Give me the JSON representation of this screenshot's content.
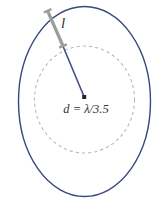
{
  "figure": {
    "labels": {
      "element_length": "l",
      "diameter": "d = λ/3.5"
    },
    "colors": {
      "background": "#ffffff",
      "boundary": "#39497b",
      "feed_line": "#41507f",
      "element_bar": "#9c9c9c",
      "dashed_circle": "#b9b9b9",
      "center_dot": "#26232c",
      "label_text": "#38302b"
    }
  }
}
